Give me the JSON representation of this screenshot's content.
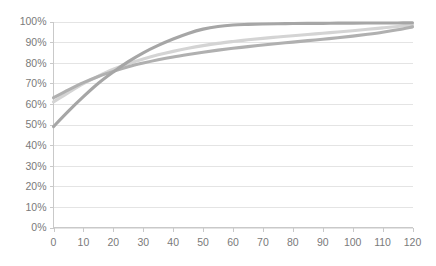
{
  "chart_data": {
    "type": "line",
    "title": "",
    "subtitle": "",
    "xlabel": "",
    "ylabel": "",
    "xlim": [
      0,
      120
    ],
    "ylim": [
      0,
      1.0
    ],
    "grid": true,
    "legend": "none",
    "x_tick_labels": [
      "0",
      "10",
      "20",
      "30",
      "40",
      "50",
      "60",
      "70",
      "80",
      "90",
      "100",
      "110",
      "120"
    ],
    "y_tick_labels": [
      "0%",
      "10%",
      "20%",
      "30%",
      "40%",
      "50%",
      "60%",
      "70%",
      "80%",
      "90%",
      "100%"
    ],
    "x_ticks": [
      0,
      10,
      20,
      30,
      40,
      50,
      60,
      70,
      80,
      90,
      100,
      110,
      120
    ],
    "y_ticks": [
      0,
      0.1,
      0.2,
      0.3,
      0.4,
      0.5,
      0.6,
      0.7,
      0.8,
      0.9,
      1.0
    ],
    "x": [
      0,
      5,
      10,
      15,
      20,
      25,
      30,
      35,
      40,
      45,
      50,
      55,
      60,
      65,
      70,
      75,
      80,
      85,
      90,
      95,
      100,
      105,
      110,
      115,
      120
    ],
    "series": [
      {
        "name": "series-1-steep",
        "color": "#a6a6a6",
        "values": [
          0.49,
          0.565,
          0.635,
          0.7,
          0.755,
          0.805,
          0.848,
          0.884,
          0.915,
          0.942,
          0.963,
          0.976,
          0.983,
          0.986,
          0.988,
          0.989,
          0.99,
          0.991,
          0.991,
          0.992,
          0.992,
          0.993,
          0.993,
          0.993,
          0.994
        ]
      },
      {
        "name": "series-2-light",
        "color": "#d4d4d4",
        "values": [
          0.61,
          0.655,
          0.698,
          0.735,
          0.768,
          0.795,
          0.818,
          0.838,
          0.855,
          0.87,
          0.883,
          0.894,
          0.903,
          0.911,
          0.918,
          0.925,
          0.931,
          0.937,
          0.943,
          0.949,
          0.955,
          0.962,
          0.969,
          0.976,
          0.983
        ]
      },
      {
        "name": "series-3-mid",
        "color": "#b0b0b0",
        "values": [
          0.63,
          0.668,
          0.703,
          0.733,
          0.758,
          0.78,
          0.798,
          0.814,
          0.828,
          0.84,
          0.851,
          0.861,
          0.87,
          0.878,
          0.886,
          0.893,
          0.9,
          0.907,
          0.914,
          0.921,
          0.929,
          0.938,
          0.948,
          0.96,
          0.974
        ]
      }
    ]
  },
  "colors": {
    "background": "#ffffff",
    "gridline": "#e4e4e4",
    "axis": "#c9c9c9",
    "tick_text": "#7a7a7a"
  }
}
